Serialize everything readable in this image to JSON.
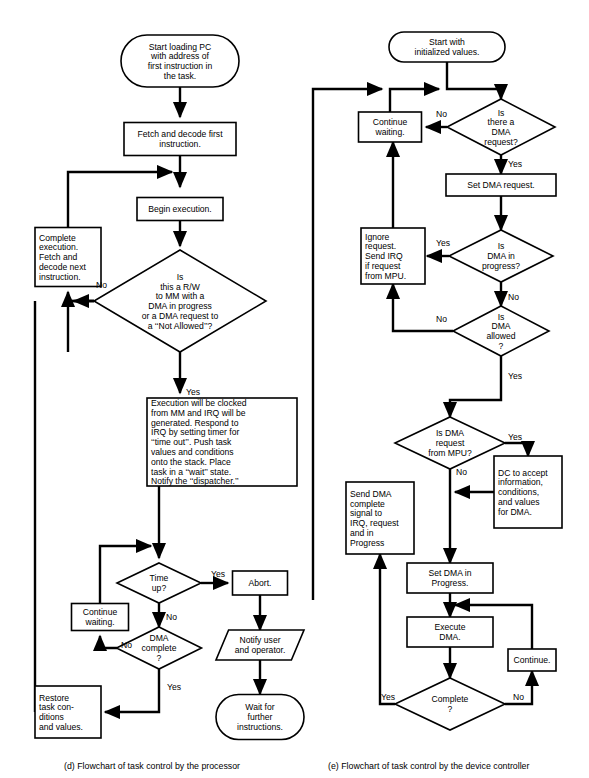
{
  "figure": {
    "title": "",
    "panels": [
      {
        "id": "d",
        "caption": "(d)  Flowchart of task control by the processor",
        "nodes": [
          {
            "id": "d_start",
            "type": "terminator",
            "x": 180,
            "y": 61,
            "w": 118,
            "h": 52,
            "lines": [
              "Start loading PC",
              "with address of",
              "first instruction in",
              "the task."
            ]
          },
          {
            "id": "d_fetch",
            "type": "process",
            "x": 180,
            "y": 139,
            "w": 112,
            "h": 33,
            "lines": [
              "Fetch and decode first",
              "instruction."
            ]
          },
          {
            "id": "d_begin",
            "type": "process",
            "x": 180,
            "y": 209,
            "w": 86,
            "h": 23,
            "lines": [
              "Begin execution."
            ]
          },
          {
            "id": "d_complete",
            "type": "process",
            "x": 68,
            "y": 257,
            "w": 66,
            "h": 59,
            "align": "left",
            "lines": [
              "Complete",
              "execution.",
              "Fetch and",
              "decode next",
              "instruction."
            ]
          },
          {
            "id": "d_isrw",
            "type": "decision",
            "x": 180,
            "y": 301,
            "w": 172,
            "h": 102,
            "lines": [
              "Is",
              "this a R/W",
              "to MM with a",
              "DMA in progress",
              "or a DMA request to",
              "a ‘‘Not Allowed’’?"
            ]
          },
          {
            "id": "d_exec",
            "type": "process",
            "x": 222,
            "y": 442,
            "w": 150,
            "h": 88,
            "align": "left",
            "lines": [
              "Execution will be clocked",
              "from MM and IRQ will be",
              "generated.  Respond to",
              "IRQ by setting timer for",
              "‘‘time out’’.  Push task",
              "values and conditions",
              "onto the stack.  Place",
              "task in a ‘‘wait’’ state.",
              "Notify the ‘‘dispatcher.’’"
            ]
          },
          {
            "id": "d_timeup",
            "type": "decision",
            "x": 159,
            "y": 583,
            "w": 84,
            "h": 40,
            "lines": [
              "Time",
              "up?"
            ]
          },
          {
            "id": "d_abort",
            "type": "process",
            "x": 260,
            "y": 583,
            "w": 55,
            "h": 24,
            "lines": [
              "Abort."
            ]
          },
          {
            "id": "d_contwait",
            "type": "process",
            "x": 100,
            "y": 617,
            "w": 57,
            "h": 27,
            "lines": [
              "Continue",
              "waiting."
            ]
          },
          {
            "id": "d_dmacomplete",
            "type": "decision",
            "x": 159,
            "y": 648,
            "w": 85,
            "h": 42,
            "lines": [
              "DMA",
              "complete",
              "?"
            ]
          },
          {
            "id": "d_notify",
            "type": "parallelogram",
            "x": 260,
            "y": 645,
            "w": 88,
            "h": 30,
            "lines": [
              "Notify user",
              "and operator."
            ]
          },
          {
            "id": "d_restore",
            "type": "process",
            "x": 68,
            "y": 712,
            "w": 66,
            "h": 52,
            "align": "left",
            "lines": [
              "Restore",
              "task con-",
              "ditions",
              "and values."
            ]
          },
          {
            "id": "d_wait",
            "type": "terminator",
            "x": 260,
            "y": 717,
            "w": 88,
            "h": 45,
            "lines": [
              "Wait for",
              "further",
              "instructions."
            ]
          }
        ],
        "edge_labels": [
          {
            "text": "No",
            "x": 96,
            "y": 288
          },
          {
            "text": "Yes",
            "x": 186,
            "y": 395
          },
          {
            "text": "Yes",
            "x": 211,
            "y": 577
          },
          {
            "text": "No",
            "x": 166,
            "y": 620
          },
          {
            "text": "No",
            "x": 121,
            "y": 648
          },
          {
            "text": "Yes",
            "x": 167,
            "y": 690
          }
        ]
      },
      {
        "id": "e",
        "caption": "(e)  Flowchart of task control by the device controller",
        "nodes": [
          {
            "id": "e_start",
            "type": "terminator",
            "x": 447,
            "y": 47,
            "w": 116,
            "h": 30,
            "lines": [
              "Start with",
              "initialized values."
            ]
          },
          {
            "id": "e_isdma",
            "type": "decision",
            "x": 501,
            "y": 127,
            "w": 108,
            "h": 56,
            "lines": [
              "Is",
              "there a",
              "DMA",
              "request?"
            ]
          },
          {
            "id": "e_contwait",
            "type": "process",
            "x": 390,
            "y": 127,
            "w": 63,
            "h": 30,
            "lines": [
              "Continue",
              "waiting."
            ]
          },
          {
            "id": "e_setreq",
            "type": "process",
            "x": 501,
            "y": 185,
            "w": 110,
            "h": 22,
            "lines": [
              "Set DMA request."
            ]
          },
          {
            "id": "e_inprog",
            "type": "decision",
            "x": 501,
            "y": 256,
            "w": 104,
            "h": 52,
            "lines": [
              "Is",
              "DMA in",
              "progress?"
            ]
          },
          {
            "id": "e_ignore",
            "type": "process",
            "x": 393,
            "y": 256,
            "w": 64,
            "h": 56,
            "align": "left",
            "lines": [
              "Ignore",
              "request.",
              "Send IRQ",
              "if request",
              "from MPU."
            ]
          },
          {
            "id": "e_allowed",
            "type": "decision",
            "x": 501,
            "y": 331,
            "w": 96,
            "h": 50,
            "lines": [
              "Is",
              "DMA",
              "allowed",
              "?"
            ]
          },
          {
            "id": "e_frommpu",
            "type": "decision",
            "x": 450,
            "y": 443,
            "w": 110,
            "h": 52,
            "lines": [
              "Is DMA",
              "request",
              "from MPU?"
            ]
          },
          {
            "id": "e_dcaccept",
            "type": "process",
            "x": 528,
            "y": 492,
            "w": 68,
            "h": 72,
            "align": "left",
            "lines": [
              "DC to accept",
              "information,",
              "conditions,",
              "and values",
              "for DMA."
            ]
          },
          {
            "id": "e_senddma",
            "type": "process",
            "x": 380,
            "y": 518,
            "w": 68,
            "h": 72,
            "align": "left",
            "lines": [
              "Send DMA",
              "complete",
              "signal to",
              "IRQ, request",
              "and  in",
              "Progress"
            ]
          },
          {
            "id": "e_setinprog",
            "type": "process",
            "x": 450,
            "y": 578,
            "w": 86,
            "h": 30,
            "lines": [
              "Set DMA in",
              "Progress."
            ]
          },
          {
            "id": "e_execute",
            "type": "process",
            "x": 450,
            "y": 632,
            "w": 86,
            "h": 30,
            "lines": [
              "Execute",
              "DMA."
            ]
          },
          {
            "id": "e_continue",
            "type": "process",
            "x": 532,
            "y": 660,
            "w": 48,
            "h": 22,
            "lines": [
              "Continue."
            ]
          },
          {
            "id": "e_complete",
            "type": "decision",
            "x": 450,
            "y": 704,
            "w": 110,
            "h": 52,
            "lines": [
              "Complete",
              "?"
            ]
          }
        ],
        "edge_labels": [
          {
            "text": "No",
            "x": 436,
            "y": 117
          },
          {
            "text": "Yes",
            "x": 508,
            "y": 167
          },
          {
            "text": "Yes",
            "x": 436,
            "y": 246
          },
          {
            "text": "No",
            "x": 508,
            "y": 300
          },
          {
            "text": "No",
            "x": 436,
            "y": 322
          },
          {
            "text": "Yes",
            "x": 508,
            "y": 379
          },
          {
            "text": "Yes",
            "x": 508,
            "y": 440
          },
          {
            "text": "No",
            "x": 456,
            "y": 475
          },
          {
            "text": "Yes",
            "x": 381,
            "y": 700
          },
          {
            "text": "No",
            "x": 513,
            "y": 700
          }
        ]
      }
    ],
    "colors": {
      "stroke": "#000000",
      "fill": "#ffffff",
      "background": "#ffffff"
    }
  }
}
